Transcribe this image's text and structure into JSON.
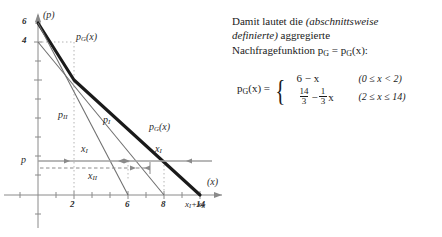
{
  "figure": {
    "axis_labels": {
      "y": "(p)",
      "x": "(x)"
    },
    "y_ticks": [
      {
        "value": 6,
        "label": "6"
      },
      {
        "value": 4,
        "label": "4"
      },
      {
        "value": 1.6,
        "label": "p"
      }
    ],
    "x_ticks": [
      {
        "value": 2,
        "label": "2"
      },
      {
        "value": 6,
        "label": "6"
      },
      {
        "value": 8,
        "label": "8"
      },
      {
        "value": 10,
        "label": "x₁+x₁₁",
        "label_base": "x",
        "sub_a": "I",
        "sub_b": "II"
      },
      {
        "value": 14,
        "label": "14"
      }
    ],
    "curve_labels": [
      {
        "name": "pG-upper-label",
        "base": "p",
        "sub": "G",
        "suffix": "(x)"
      },
      {
        "name": "pG-lower-label",
        "base": "p",
        "sub": "G",
        "suffix": "(x)"
      },
      {
        "name": "pI-label",
        "base": "p",
        "sub": "I",
        "suffix": ""
      },
      {
        "name": "pII-label",
        "base": "p",
        "sub": "II",
        "suffix": ""
      }
    ],
    "quantity_labels": [
      {
        "name": "xI-left-label",
        "base": "x",
        "sub": "I"
      },
      {
        "name": "xI-right-label",
        "base": "x",
        "sub": "I"
      },
      {
        "name": "xII-label",
        "base": "x",
        "sub": "II"
      }
    ]
  },
  "panel": {
    "line1_a": "Damit lautet die ",
    "line1_b": "(abschnittsweise",
    "line2_a": "definierte)",
    "line2_b": " aggregierte",
    "line3_a": "Nachfragefunktion p",
    "line3_sub": "G",
    "line3_b": " = p",
    "line3_sub2": "G",
    "line3_c": "(x):"
  },
  "formula": {
    "lhs_base": "p",
    "lhs_sub": "G",
    "lhs_tail": "(x)",
    "equals": "=",
    "cases": [
      {
        "expr_type": "plain",
        "expr": "6 − x",
        "condition": "(0 ≤ x < 2)"
      },
      {
        "expr_type": "fraction",
        "num1": "14",
        "den1": "3",
        "minus": "−",
        "num2": "1",
        "den2": "3",
        "var": "x",
        "condition": "(2 ≤ x ≤ 14)"
      }
    ]
  },
  "colors": {
    "ink": "#2b2b2b",
    "axis": "#8a8a8a",
    "thin_curve": "#6e6e6e",
    "thick_curve": "#1a1a1a",
    "dashed": "#9a9a9a"
  }
}
